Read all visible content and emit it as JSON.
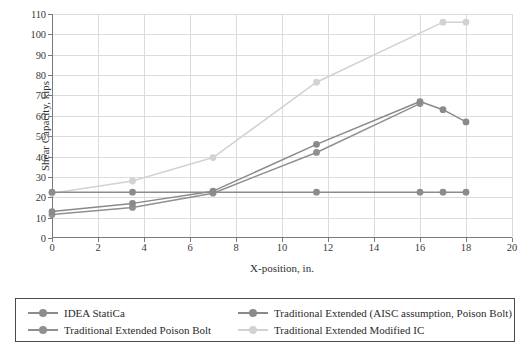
{
  "chart_data": {
    "type": "line",
    "title": "",
    "xlabel": "X-position, in.",
    "ylabel": "Shear Capacity, kips",
    "xlim": [
      0,
      20
    ],
    "ylim": [
      0,
      110
    ],
    "xticks": [
      0,
      2,
      4,
      6,
      8,
      10,
      12,
      14,
      16,
      18,
      20
    ],
    "yticks": [
      0,
      10,
      20,
      30,
      40,
      50,
      60,
      70,
      80,
      90,
      100,
      110
    ],
    "grid": true,
    "legend_position": "bottom",
    "series": [
      {
        "name": "IDEA StatiCa",
        "color": "#8c8c8c",
        "x": [
          0,
          3.5,
          7,
          11.5,
          16,
          17,
          18
        ],
        "values": [
          22.5,
          22.5,
          22.5,
          22.5,
          22.5,
          22.5,
          22.5
        ]
      },
      {
        "name": "Traditional Extended (AISC assumption, Poison Bolt)",
        "color": "#8a8a8a",
        "x": [
          0,
          3.5,
          7,
          11.5,
          16,
          17,
          18
        ],
        "values": [
          13.0,
          17.0,
          23.0,
          46.0,
          67.0,
          63.0,
          57.0
        ]
      },
      {
        "name": "Traditional Extended Poison Bolt",
        "color": "#909090",
        "x": [
          0,
          3.5,
          7,
          11.5,
          16
        ],
        "values": [
          11.5,
          15.0,
          22.0,
          42.0,
          66.0
        ]
      },
      {
        "name": "Traditional Extended Modified IC",
        "color": "#d2d2d2",
        "x": [
          0,
          3.5,
          7,
          11.5,
          17,
          18
        ],
        "values": [
          22.0,
          28.0,
          39.5,
          76.5,
          106.0,
          106.0
        ]
      }
    ]
  },
  "legend": {
    "entries": [
      {
        "label": "IDEA StatiCa"
      },
      {
        "label": "Traditional Extended (AISC assumption, Poison Bolt)"
      },
      {
        "label": "Traditional Extended Poison Bolt"
      },
      {
        "label": "Traditional Extended Modified IC"
      }
    ]
  }
}
